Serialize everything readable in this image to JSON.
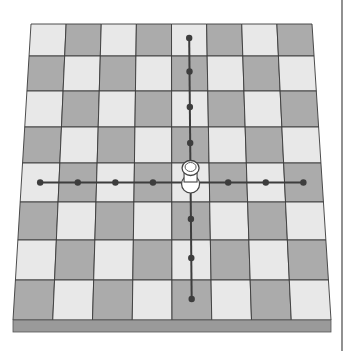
{
  "diagram": {
    "board": {
      "files": 8,
      "ranks": 8,
      "top_left_color": "light",
      "light_color": "#e8e8e8",
      "dark_color": "#ababab",
      "grid_line_color": "#3a3a3a",
      "edge_color": "#9a9a9a"
    },
    "piece": {
      "type": "rook",
      "color": "white",
      "file": 4,
      "row": 4
    },
    "moves": {
      "vertical_rows": [
        0,
        1,
        2,
        3,
        5,
        6,
        7
      ],
      "horizontal_files": [
        0,
        1,
        2,
        3,
        5,
        6,
        7
      ],
      "line_color": "#3d3d3d"
    },
    "divider_color": "#555555"
  }
}
